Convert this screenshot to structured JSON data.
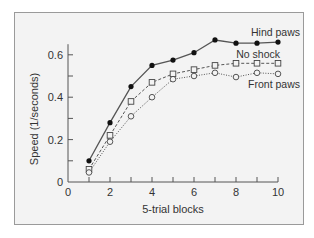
{
  "chart_data": {
    "type": "line",
    "title": "",
    "xlabel": "5-trial blocks",
    "ylabel": "Speed (1/seconds)",
    "xlim": [
      0,
      10
    ],
    "ylim": [
      0,
      0.7
    ],
    "x_ticks": [
      0,
      2,
      4,
      6,
      8,
      10
    ],
    "x_tick_labels": [
      "0",
      "2",
      "4",
      "6",
      "8",
      "10"
    ],
    "y_ticks": [
      0,
      0.2,
      0.4,
      0.6
    ],
    "y_tick_labels": [
      "0",
      "0.2",
      "0.4",
      "0.6"
    ],
    "grid": false,
    "legend_position": "inline labels at right end of lines",
    "x": [
      1,
      2,
      3,
      4,
      5,
      6,
      7,
      8,
      9,
      10
    ],
    "series": [
      {
        "name": "Hind paws",
        "marker": "filled-circle",
        "line": "solid",
        "values": [
          0.1,
          0.28,
          0.45,
          0.55,
          0.575,
          0.61,
          0.67,
          0.655,
          0.655,
          0.66
        ]
      },
      {
        "name": "No shock",
        "marker": "open-square",
        "line": "dashed",
        "values": [
          0.06,
          0.22,
          0.38,
          0.47,
          0.51,
          0.53,
          0.55,
          0.56,
          0.56,
          0.56
        ]
      },
      {
        "name": "Front paws",
        "marker": "open-circle",
        "line": "dotted",
        "values": [
          0.045,
          0.19,
          0.31,
          0.4,
          0.485,
          0.5,
          0.515,
          0.495,
          0.515,
          0.51
        ]
      }
    ],
    "colors": {
      "line": "#555555",
      "marker_fill": "#111111",
      "background": "#f3f3f3",
      "frame": "#9a9a9a"
    }
  }
}
